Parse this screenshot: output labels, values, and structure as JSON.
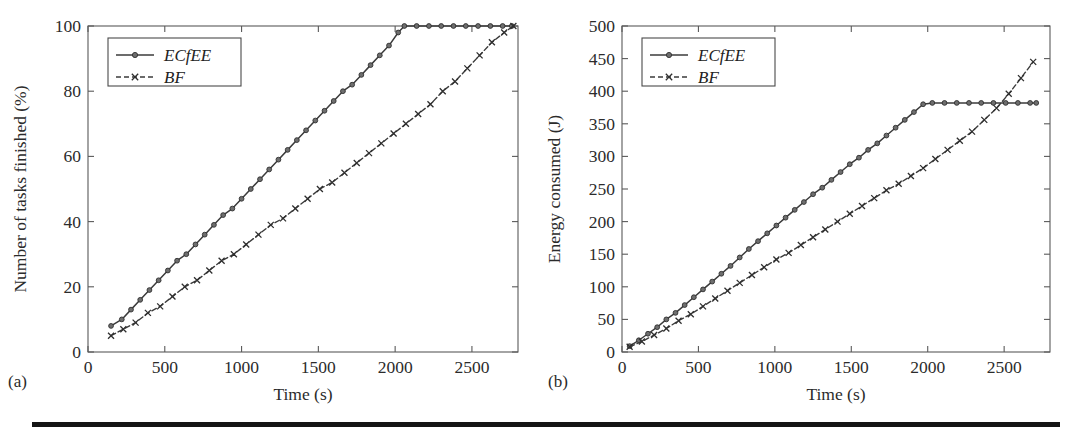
{
  "figure": {
    "panels": [
      {
        "tag": "(a)"
      },
      {
        "tag": "(b)"
      }
    ],
    "rule_color": "#141414"
  },
  "chart_data": [
    {
      "type": "line",
      "panel": "(a)",
      "title": "",
      "xlabel": "Time (s)",
      "ylabel": "Number of tasks finished (%)",
      "xlim": [
        0,
        2800
      ],
      "ylim": [
        0,
        100
      ],
      "xticks": [
        0,
        500,
        1000,
        1500,
        2000,
        2500
      ],
      "yticks": [
        0,
        20,
        40,
        60,
        80,
        100
      ],
      "grid": false,
      "legend_position": "upper-left",
      "series": [
        {
          "name": "ECfEE",
          "marker": "circle",
          "linestyle": "solid",
          "color": "#3b3b3b",
          "x": [
            150,
            220,
            280,
            340,
            400,
            460,
            520,
            580,
            640,
            700,
            760,
            820,
            880,
            940,
            1000,
            1060,
            1120,
            1180,
            1240,
            1300,
            1360,
            1420,
            1480,
            1540,
            1600,
            1660,
            1720,
            1780,
            1840,
            1900,
            1960,
            2020,
            2060,
            2140,
            2220,
            2300,
            2380,
            2460,
            2540,
            2620,
            2700,
            2760
          ],
          "y": [
            8,
            10,
            13,
            16,
            19,
            22,
            25,
            28,
            30,
            33,
            36,
            39,
            42,
            44,
            47,
            50,
            53,
            56,
            59,
            62,
            65,
            68,
            71,
            74,
            77,
            80,
            82,
            85,
            88,
            91,
            94,
            98,
            100,
            100,
            100,
            100,
            100,
            100,
            100,
            100,
            100,
            100
          ]
        },
        {
          "name": "BF",
          "marker": "x",
          "linestyle": "dashed",
          "color": "#3b3b3b",
          "x": [
            150,
            230,
            310,
            390,
            470,
            550,
            630,
            710,
            790,
            870,
            950,
            1030,
            1110,
            1190,
            1270,
            1350,
            1430,
            1510,
            1590,
            1670,
            1750,
            1830,
            1910,
            1990,
            2070,
            2150,
            2230,
            2310,
            2390,
            2470,
            2550,
            2630,
            2710,
            2770
          ],
          "y": [
            5,
            7,
            9,
            12,
            14,
            17,
            20,
            22,
            25,
            28,
            30,
            33,
            36,
            39,
            41,
            44,
            47,
            50,
            52,
            55,
            58,
            61,
            64,
            67,
            70,
            73,
            76,
            80,
            83,
            87,
            91,
            95,
            98,
            100
          ]
        }
      ]
    },
    {
      "type": "line",
      "panel": "(b)",
      "title": "",
      "xlabel": "Time (s)",
      "ylabel": "Energy consumed (J)",
      "xlim": [
        0,
        2800
      ],
      "ylim": [
        0,
        500
      ],
      "xticks": [
        0,
        500,
        1000,
        1500,
        2000,
        2500
      ],
      "yticks": [
        0,
        50,
        100,
        150,
        200,
        250,
        300,
        350,
        400,
        450,
        500
      ],
      "grid": false,
      "legend_position": "upper-left",
      "series": [
        {
          "name": "ECfEE",
          "marker": "circle",
          "linestyle": "solid",
          "color": "#3b3b3b",
          "x": [
            50,
            110,
            170,
            230,
            290,
            350,
            410,
            470,
            530,
            590,
            650,
            710,
            770,
            830,
            890,
            950,
            1010,
            1070,
            1130,
            1190,
            1250,
            1310,
            1370,
            1430,
            1490,
            1550,
            1610,
            1670,
            1730,
            1790,
            1850,
            1910,
            1970,
            2030,
            2110,
            2190,
            2270,
            2350,
            2430,
            2510,
            2590,
            2670,
            2710
          ],
          "y": [
            9,
            18,
            28,
            38,
            50,
            60,
            72,
            84,
            96,
            108,
            120,
            132,
            145,
            158,
            170,
            182,
            194,
            206,
            218,
            230,
            242,
            252,
            264,
            276,
            288,
            298,
            310,
            320,
            332,
            344,
            356,
            368,
            380,
            382,
            382,
            382,
            382,
            382,
            382,
            382,
            382,
            382,
            382
          ]
        },
        {
          "name": "BF",
          "marker": "x",
          "linestyle": "dashed",
          "color": "#3b3b3b",
          "x": [
            50,
            130,
            210,
            290,
            370,
            450,
            530,
            610,
            690,
            770,
            850,
            930,
            1010,
            1090,
            1170,
            1250,
            1330,
            1410,
            1490,
            1570,
            1650,
            1730,
            1810,
            1890,
            1970,
            2050,
            2130,
            2210,
            2290,
            2370,
            2450,
            2530,
            2610,
            2690
          ],
          "y": [
            8,
            16,
            26,
            36,
            48,
            58,
            70,
            82,
            94,
            106,
            118,
            130,
            142,
            152,
            164,
            176,
            188,
            200,
            212,
            224,
            236,
            248,
            258,
            270,
            282,
            296,
            310,
            324,
            338,
            356,
            374,
            396,
            420,
            445
          ]
        }
      ]
    }
  ]
}
